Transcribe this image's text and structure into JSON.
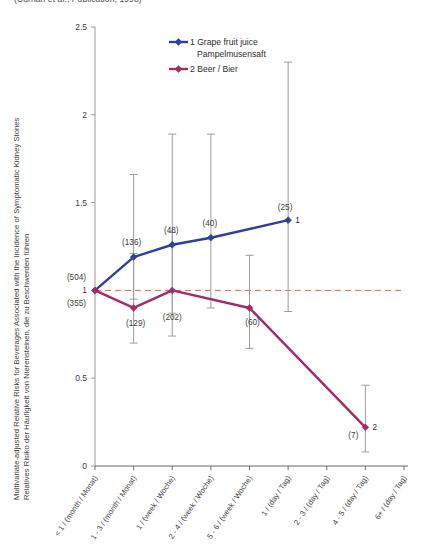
{
  "top_caption": "(Curhan et al., Publication, 1998)",
  "axis": {
    "y_ticks": [
      "0",
      "0.5",
      "1",
      "1.5",
      "2",
      "2.5"
    ],
    "y_label_line1": "Multivariate-adjusted Relative Risks for Beverages Associated with the Incidence of Symptomatic Kidney Stones",
    "y_label_line2": "Relatives Risiko der Häufigkeit von Nierensteinen, die zu Beschwerden führen",
    "x_tick_labels": [
      "< 1 / (month / Monat)",
      "1 - 3 / (month / Monat)",
      "1 / (week / Woche)",
      "2 - 4 / (week / Woche)",
      "5 - 6 / (week / Woche)",
      "1 / (day / Tag)",
      "2 - 3 / (day / Tag)",
      "4 - 5 / (day / Tag)",
      "6+ / (day / Tag)"
    ]
  },
  "legend": {
    "items": [
      {
        "label_line1": "1 Grape fruit juice",
        "label_line2": "Pampelmusensaft",
        "color": "#2f3f9e"
      },
      {
        "label_line1": "2 Beer / Bier",
        "label_line2": "",
        "color": "#a32b66"
      }
    ]
  },
  "series_end_labels": {
    "juice": "1",
    "beer": "2"
  },
  "reference_line": {
    "value": 1,
    "color": "#e8663c"
  },
  "chart_data": {
    "type": "line",
    "title": "(Curhan et al., Publication, 1998)",
    "xlabel": "",
    "ylabel": "Multivariate-adjusted Relative Risks for Beverages Associated with the Incidence of Symptomatic Kidney Stones / Relatives Risiko der Häufigkeit von Nierensteinen, die zu Beschwerden führen",
    "ylim": [
      0,
      2.5
    ],
    "grid": false,
    "legend_position": "top-center",
    "reference_line_y": 1,
    "categories": [
      "< 1 / (month / Monat)",
      "1 - 3 / (month / Monat)",
      "1 / (week / Woche)",
      "2 - 4 / (week / Woche)",
      "5 - 6 / (week / Woche)",
      "1 / (day / Tag)",
      "2 - 3 / (day / Tag)",
      "4 - 5 / (day / Tag)",
      "6+ / (day / Tag)"
    ],
    "series": [
      {
        "name": "1 Grape fruit juice / Pampelmusensaft",
        "color": "#2f3f9e",
        "points": [
          {
            "category_index": 0,
            "value": 1.0,
            "ci_low": 1.0,
            "ci_high": 1.0,
            "n_label": "(504)",
            "n": 504
          },
          {
            "category_index": 1,
            "value": 1.19,
            "ci_low": 0.95,
            "ci_high": 1.66,
            "n_label": "(136)",
            "n": 136
          },
          {
            "category_index": 2,
            "value": 1.26,
            "ci_low": 0.87,
            "ci_high": 1.89,
            "n_label": "(48)",
            "n": 48
          },
          {
            "category_index": 3,
            "value": 1.3,
            "ci_low": 0.9,
            "ci_high": 1.89,
            "n_label": "(40)",
            "n": 40
          },
          {
            "category_index": 5,
            "value": 1.4,
            "ci_low": 0.88,
            "ci_high": 2.3,
            "n_label": "(25)",
            "n": 25
          }
        ]
      },
      {
        "name": "2 Beer / Bier",
        "color": "#a32b66",
        "points": [
          {
            "category_index": 0,
            "value": 1.0,
            "ci_low": 1.0,
            "ci_high": 1.0,
            "n_label": "(355)",
            "n": 355
          },
          {
            "category_index": 1,
            "value": 0.9,
            "ci_low": 0.7,
            "ci_high": 1.21,
            "n_label": "(129)",
            "n": 129
          },
          {
            "category_index": 2,
            "value": 1.0,
            "ci_low": 0.74,
            "ci_high": 1.33,
            "n_label": "(202)",
            "n": 202
          },
          {
            "category_index": 4,
            "value": 0.9,
            "ci_low": 0.67,
            "ci_high": 1.2,
            "n_label": "(60)",
            "n": 60
          },
          {
            "category_index": 7,
            "value": 0.22,
            "ci_low": 0.08,
            "ci_high": 0.46,
            "n_label": "(7)",
            "n": 7
          }
        ]
      }
    ]
  }
}
